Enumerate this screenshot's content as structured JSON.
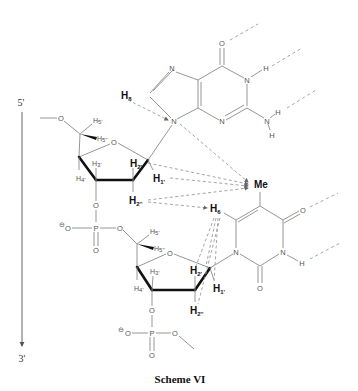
{
  "caption": "Scheme VI",
  "strand": {
    "start_label": "5'",
    "end_label": "3'"
  },
  "guanine": {
    "atoms": {
      "O6": "O",
      "N1": "N",
      "H1": "H",
      "N2": "N",
      "H21": "H",
      "H22": "H",
      "N3": "N",
      "N7": "N",
      "N9": "N"
    },
    "h8": {
      "base": "H",
      "sub": "8"
    }
  },
  "thymine": {
    "atoms": {
      "O4": "O",
      "N3": "N",
      "H3": "H",
      "O2": "O",
      "N1": "N"
    },
    "me": "Me",
    "h6": {
      "base": "H",
      "sub": "6"
    }
  },
  "sugar1": {
    "O5": "O",
    "O4": "O",
    "O3": "O",
    "h5a": {
      "base": "H",
      "sub": "5'"
    },
    "h5b": {
      "base": "H",
      "sub": "5''"
    },
    "h4": {
      "base": "H",
      "sub": "4'"
    },
    "h3": {
      "base": "H",
      "sub": "3'"
    },
    "h2a": {
      "base": "H",
      "sub": "2'"
    },
    "h2b": {
      "base": "H",
      "sub": "2''"
    },
    "h1": {
      "base": "H",
      "sub": "1'"
    }
  },
  "phosphate1": {
    "P": "P",
    "O_minus": "O",
    "charge": "⊖",
    "O_ester": "O",
    "O_double": "O"
  },
  "sugar2": {
    "O4": "O",
    "O3": "O",
    "h5a": {
      "base": "H",
      "sub": "5'"
    },
    "h5b": {
      "base": "H",
      "sub": "5''"
    },
    "h4": {
      "base": "H",
      "sub": "4'"
    },
    "h3": {
      "base": "H",
      "sub": "3'"
    },
    "h2a": {
      "base": "H",
      "sub": "2'"
    },
    "h2b": {
      "base": "H",
      "sub": "2''"
    },
    "h1": {
      "base": "H",
      "sub": "1'"
    }
  },
  "phosphate2": {
    "P": "P",
    "O_minus": "O",
    "charge": "⊖",
    "O_ester": "O",
    "O_double": "O"
  }
}
